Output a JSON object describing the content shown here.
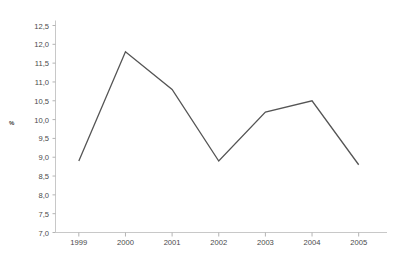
{
  "chart_data": {
    "type": "line",
    "title": "",
    "subtitle": "",
    "xlabel": "",
    "ylabel": "%",
    "categories": [
      "1999",
      "2000",
      "2001",
      "2002",
      "2003",
      "2004",
      "2005"
    ],
    "values": [
      8.9,
      11.8,
      10.8,
      8.9,
      10.2,
      10.5,
      8.8
    ],
    "series": [
      {
        "name": "%",
        "values": [
          8.9,
          11.8,
          10.8,
          8.9,
          10.2,
          10.5,
          8.8
        ]
      }
    ],
    "ylim": [
      7.0,
      12.5
    ],
    "ytick_labels": [
      "12,5",
      "12,0",
      "11,5",
      "11,0",
      "10,5",
      "10,0",
      "9,5",
      "9,0",
      "8,5",
      "8,0",
      "7,5",
      "7,0"
    ],
    "ytick_values": [
      12.5,
      12.0,
      11.5,
      11.0,
      10.5,
      10.0,
      9.5,
      9.0,
      8.5,
      8.0,
      7.5,
      7.0
    ],
    "ytick_step": 0.5,
    "decimal_separator": ",",
    "grid": false,
    "legend": false,
    "legend_position": "none",
    "line_color": "#555555",
    "axis_color": "#c8c8c8",
    "tick_color": "#b4b4b4",
    "text_color": "#4a4a4a",
    "background_color": "#ffffff",
    "line_width": 1.3,
    "markers": false,
    "annotations": []
  }
}
